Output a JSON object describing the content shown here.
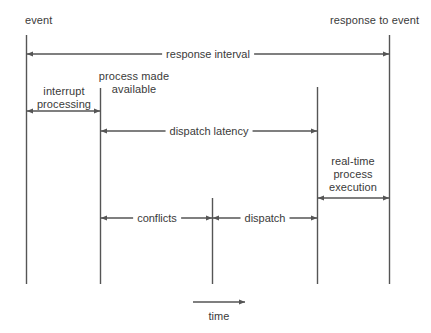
{
  "diagram": {
    "type": "timeline-diagram",
    "stroke_color": "#555555",
    "text_color": "#3a3a3a",
    "background": "#ffffff",
    "top_labels": {
      "event": "event",
      "response_to_event": "response to event"
    },
    "annotations": {
      "process_made_available": "process made\navailable",
      "process_made_available_line1": "process made",
      "process_made_available_line2": "available",
      "interrupt_processing_line1": "interrupt",
      "interrupt_processing_line2": "processing",
      "real_time_line1": "real-time",
      "real_time_line2": "process",
      "real_time_line3": "execution"
    },
    "intervals": [
      {
        "name": "response-interval",
        "label": "response interval",
        "from_line": 1,
        "to_line": 5,
        "y": 54
      },
      {
        "name": "interrupt-processing",
        "label": "interrupt processing",
        "from_line": 1,
        "to_line": 2,
        "y": 111
      },
      {
        "name": "dispatch-latency",
        "label": "dispatch latency",
        "from_line": 2,
        "to_line": 4,
        "y": 131
      },
      {
        "name": "real-time-process-execution",
        "label": "real-time process execution",
        "from_line": 4,
        "to_line": 5,
        "y": 198
      },
      {
        "name": "conflicts",
        "label": "conflicts",
        "from_line": 2,
        "to_line": 3,
        "y": 218
      },
      {
        "name": "dispatch",
        "label": "dispatch",
        "from_line": 3,
        "to_line": 4,
        "y": 218
      }
    ],
    "time_axis": {
      "label": "time",
      "direction": "left-to-right"
    }
  }
}
